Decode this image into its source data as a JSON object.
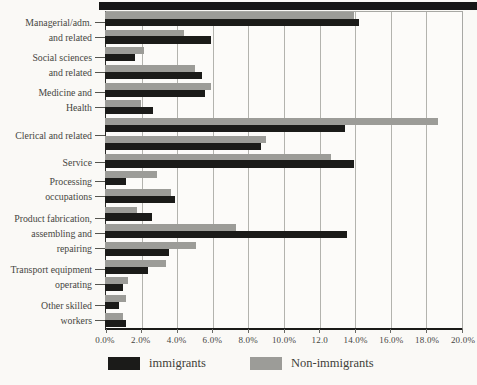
{
  "chart_data": {
    "type": "bar",
    "orientation": "horizontal",
    "title": "",
    "xlabel": "",
    "x_max": 20,
    "x_tick_step": 2,
    "x_ticks": [
      "0.0%",
      "2.0%",
      "4.0%",
      "6.0%",
      "8.0%",
      "10.0%",
      "12.0",
      "14.0%",
      "16.0%",
      "18.0%",
      "20.0%"
    ],
    "grid": true,
    "legend_position": "bottom",
    "legend": [
      {
        "name": "immigrants",
        "label": "immigrants",
        "color": "#1b1b19"
      },
      {
        "name": "non_immigrants",
        "label": "Non-immigrants",
        "color": "#9c9c98"
      }
    ],
    "series_note": "each group contains one or more bar pairs; within a pair the gray (Non-immigrants) bar is drawn above the black (immigrants) bar; values are percentages",
    "groups": [
      {
        "label_lines": [
          "Managerial/adm.",
          "and related"
        ],
        "rows": [
          {
            "non_immigrants": 13.9,
            "immigrants": 14.2
          },
          {
            "non_immigrants": 4.4,
            "immigrants": 5.9
          }
        ]
      },
      {
        "label_lines": [
          "Social sciences",
          "and related"
        ],
        "rows": [
          {
            "non_immigrants": 2.2,
            "immigrants": 1.7
          },
          {
            "non_immigrants": 5.0,
            "immigrants": 5.4
          }
        ]
      },
      {
        "label_lines": [
          "Medicine and",
          "Health"
        ],
        "rows": [
          {
            "non_immigrants": 5.9,
            "immigrants": 5.6
          },
          {
            "non_immigrants": 2.0,
            "immigrants": 2.7
          }
        ]
      },
      {
        "label_lines": [
          "Clerical and related"
        ],
        "rows": [
          {
            "non_immigrants": 18.6,
            "immigrants": 13.4
          },
          {
            "non_immigrants": 9.0,
            "immigrants": 8.7
          }
        ]
      },
      {
        "label_lines": [
          "Service"
        ],
        "rows": [
          {
            "non_immigrants": 12.6,
            "immigrants": 13.9
          }
        ]
      },
      {
        "label_lines": [
          "Processing",
          "occupations"
        ],
        "rows": [
          {
            "non_immigrants": 2.9,
            "immigrants": 1.2
          },
          {
            "non_immigrants": 3.7,
            "immigrants": 3.9
          }
        ]
      },
      {
        "label_lines": [
          "Product fabrication,",
          "assembling and",
          "repairing"
        ],
        "rows": [
          {
            "non_immigrants": 1.8,
            "immigrants": 2.6
          },
          {
            "non_immigrants": 7.3,
            "immigrants": 13.5
          },
          {
            "non_immigrants": 5.1,
            "immigrants": 3.6
          }
        ]
      },
      {
        "label_lines": [
          "Transport equipment",
          "operating"
        ],
        "rows": [
          {
            "non_immigrants": 3.4,
            "immigrants": 2.4
          },
          {
            "non_immigrants": 1.3,
            "immigrants": 1.0
          }
        ]
      },
      {
        "label_lines": [
          "Other skilled",
          "workers"
        ],
        "rows": [
          {
            "non_immigrants": 1.2,
            "immigrants": 0.8
          },
          {
            "non_immigrants": 1.0,
            "immigrants": 1.2
          }
        ]
      }
    ]
  },
  "colors": {
    "bar_black": "#1b1b19",
    "bar_gray": "#9c9c98",
    "grid": "#b3b3ae",
    "axis": "#1a1a18",
    "text": "#45453f",
    "top_rule": "#161616",
    "background": "#faf9f6"
  }
}
